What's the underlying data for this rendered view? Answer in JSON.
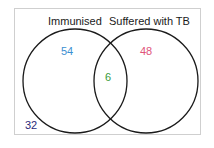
{
  "diagram": {
    "type": "venn",
    "sets": [
      {
        "label": "Immunised",
        "only_value": "54",
        "color": "#3b8fd1"
      },
      {
        "label": "Suffered with TB",
        "only_value": "48",
        "color": "#e0557a"
      }
    ],
    "intersection": {
      "value": "6",
      "color": "#3a9a3a"
    },
    "outside": {
      "value": "32",
      "color": "#2a2a7a"
    }
  }
}
